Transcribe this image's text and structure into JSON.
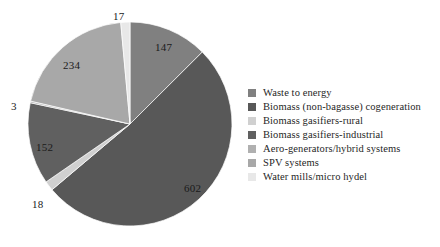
{
  "chart_data": {
    "type": "pie",
    "title": "",
    "categories": [
      "Waste to energy",
      "Biomass (non-bagasse) cogeneration",
      "Biomass gasifiers-rural",
      "Biomass gasifiers-industrial",
      "Aero-generators/hybrid systems",
      "SPV systems",
      "Water mills/micro hydel"
    ],
    "values": [
      147,
      602,
      18,
      152,
      3,
      234,
      17
    ],
    "total": 1173,
    "colors": [
      "#808080",
      "#585858",
      "#d0d0d0",
      "#606060",
      "#b0b0b0",
      "#a8a8a8",
      "#e8e8e8"
    ],
    "start_angle_deg": 0,
    "direction": "clockwise",
    "legend_position": "right",
    "grid": false,
    "data_labels": [
      "147",
      "602",
      "18",
      "152",
      "3",
      "234",
      "17"
    ]
  },
  "legend": {
    "items": [
      {
        "label": "Waste to energy",
        "color": "#808080"
      },
      {
        "label": "Biomass (non-bagasse) cogeneration",
        "color": "#585858"
      },
      {
        "label": "Biomass gasifiers-rural",
        "color": "#d0d0d0"
      },
      {
        "label": "Biomass gasifiers-industrial",
        "color": "#606060"
      },
      {
        "label": "Aero-generators/hybrid systems",
        "color": "#b0b0b0"
      },
      {
        "label": "SPV systems",
        "color": "#a8a8a8"
      },
      {
        "label": "Water mills/micro hydel",
        "color": "#e8e8e8"
      }
    ]
  },
  "labels": {
    "l147": "147",
    "l602": "602",
    "l18": "18",
    "l152": "152",
    "l3": "3",
    "l234": "234",
    "l17": "17"
  }
}
